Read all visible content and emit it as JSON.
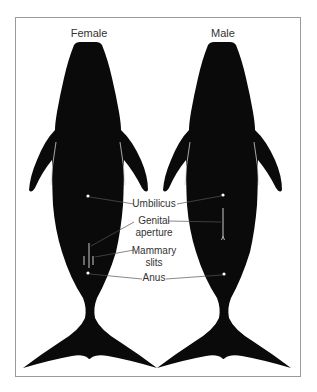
{
  "figure": {
    "columns": [
      {
        "id": "female",
        "title": "Female"
      },
      {
        "id": "male",
        "title": "Male"
      }
    ],
    "labels": {
      "umbilicus": "Umbilicus",
      "genital_line1": "Genital",
      "genital_line2": "aperture",
      "mammary_line1": "Mammary",
      "mammary_line2": "slits",
      "anus": "Anus"
    },
    "colors": {
      "silhouette": "#0a0a0a",
      "marker": "#ffffff",
      "leader": "#555555",
      "frame": "#9a9a9a"
    }
  }
}
